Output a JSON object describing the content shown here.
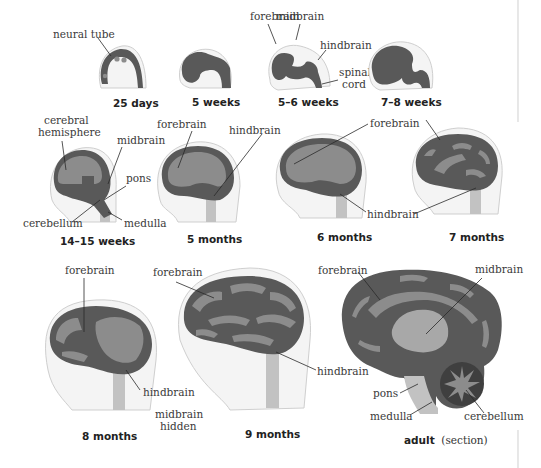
{
  "colors": {
    "brain_dark": "#595959",
    "brain_light": "#8c8c8c",
    "head_fill": "#f4f4f4",
    "head_outline": "#cfcfcf",
    "stem": "#c2c2c2",
    "text": "#333333"
  },
  "stages": [
    {
      "id": "25-days",
      "caption": "25 days",
      "labels": [
        "neural tube"
      ]
    },
    {
      "id": "5-weeks",
      "caption": "5 weeks",
      "labels": []
    },
    {
      "id": "5-6-weeks",
      "caption": "5–6 weeks",
      "labels": [
        "forebrain",
        "midbrain",
        "hindbrain",
        "spinal",
        "cord"
      ]
    },
    {
      "id": "7-8-weeks",
      "caption": "7–8 weeks",
      "labels": []
    },
    {
      "id": "14-15-weeks",
      "caption": "14–15 weeks",
      "labels": [
        "cerebral",
        "hemisphere",
        "midbrain",
        "pons",
        "cerebellum",
        "medulla"
      ]
    },
    {
      "id": "5-months",
      "caption": "5 months",
      "labels": [
        "forebrain",
        "hindbrain"
      ]
    },
    {
      "id": "6-months",
      "caption": "6 months",
      "labels": [
        "forebrain",
        "hindbrain"
      ]
    },
    {
      "id": "7-months",
      "caption": "7 months",
      "labels": []
    },
    {
      "id": "8-months",
      "caption": "8 months",
      "labels": [
        "forebrain",
        "hindbrain",
        "midbrain",
        "hidden"
      ]
    },
    {
      "id": "9-months",
      "caption": "9 months",
      "labels": [
        "forebrain",
        "hindbrain"
      ]
    },
    {
      "id": "adult",
      "caption": "adult",
      "caption_suffix": "(section)",
      "labels": [
        "forebrain",
        "midbrain",
        "pons",
        "medulla",
        "cerebellum"
      ]
    }
  ]
}
